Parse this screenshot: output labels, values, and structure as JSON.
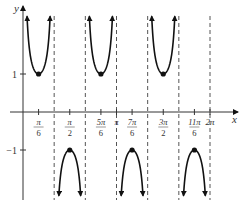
{
  "chart_data": {
    "type": "line",
    "title": "",
    "function": "y = csc(3x)",
    "xlabel": "x",
    "ylabel": "y",
    "xlim": [
      0,
      6.4
    ],
    "ylim": [
      -3,
      3
    ],
    "grid": false,
    "x_ticks": [
      {
        "value": 0.5236,
        "num": "π",
        "den": "6"
      },
      {
        "value": 1.5708,
        "num": "π",
        "den": "2"
      },
      {
        "value": 2.618,
        "num": "5π",
        "den": "6"
      },
      {
        "value": 3.1416,
        "num": "π",
        "den": ""
      },
      {
        "value": 3.6652,
        "num": "7π",
        "den": "6"
      },
      {
        "value": 4.7124,
        "num": "3π",
        "den": "2"
      },
      {
        "value": 5.7596,
        "num": "11π",
        "den": "6"
      },
      {
        "value": 6.2832,
        "num": "2π",
        "den": ""
      }
    ],
    "y_ticks": [
      {
        "value": 1,
        "label": "1"
      },
      {
        "value": -1,
        "label": "−1"
      }
    ],
    "asymptotes": [
      1.0472,
      2.0944,
      3.1416,
      4.1888,
      5.236,
      6.2832
    ],
    "extrema": [
      {
        "x": 0.5236,
        "y": 1,
        "kind": "min"
      },
      {
        "x": 1.5708,
        "y": -1,
        "kind": "max"
      },
      {
        "x": 2.618,
        "y": 1,
        "kind": "min"
      },
      {
        "x": 3.6652,
        "y": -1,
        "kind": "max"
      },
      {
        "x": 4.7124,
        "y": 1,
        "kind": "min"
      },
      {
        "x": 5.7596,
        "y": -1,
        "kind": "max"
      }
    ]
  },
  "colors": {
    "curve": "#111111",
    "axis": "#333333",
    "asymptote": "#555555"
  }
}
